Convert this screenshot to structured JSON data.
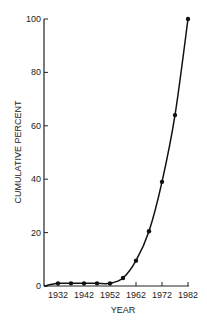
{
  "chart_data": {
    "type": "line",
    "title": "",
    "xlabel": "YEAR",
    "ylabel": "CUMULATIVE PERCENT",
    "x": [
      1932,
      1937,
      1942,
      1947,
      1952,
      1957,
      1962,
      1967,
      1972,
      1977,
      1982
    ],
    "series": [
      {
        "name": "Cumulative percent",
        "values": [
          1,
          1,
          1,
          1,
          1,
          3,
          9.5,
          20.5,
          39,
          64,
          100
        ]
      }
    ],
    "x_ticks": [
      "1932",
      "1942",
      "1952",
      "1962",
      "1972",
      "1982"
    ],
    "y_ticks": [
      "0",
      "20",
      "40",
      "60",
      "80",
      "100"
    ],
    "xlim": [
      1927,
      1983
    ],
    "ylim": [
      0,
      100
    ],
    "grid": false,
    "legend": "none",
    "colors": {
      "line": "#111111",
      "axis": "#222222",
      "text": "#222222"
    }
  }
}
